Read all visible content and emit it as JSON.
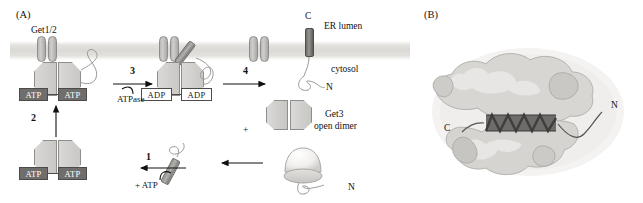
{
  "figure": {
    "panels": [
      {
        "id": "A",
        "label": "(A)"
      },
      {
        "id": "B",
        "label": "(B)"
      }
    ]
  },
  "panel_a": {
    "label": "(A)",
    "compartments": {
      "lumen": "ER lumen",
      "cytosol": "cytosol"
    },
    "receptor_label": "Get1/2",
    "open_dimer_label_line1": "Get3",
    "open_dimer_label_line2": "open dimer",
    "steps": [
      {
        "number": "1",
        "annotation": "+ ATP"
      },
      {
        "number": "2",
        "annotation": ""
      },
      {
        "number": "3",
        "annotation": "ATPase"
      },
      {
        "number": "4",
        "annotation": ""
      }
    ],
    "nucleotides": [
      {
        "state": "ATP",
        "label": "ATP",
        "site": "membrane-bound-left"
      },
      {
        "state": "ATP",
        "label": "ATP",
        "site": "membrane-bound-right"
      },
      {
        "state": "ADP",
        "label": "ADP",
        "site": "hydrolyzed-left"
      },
      {
        "state": "ADP",
        "label": "ADP",
        "site": "hydrolyzed-right"
      },
      {
        "state": "ATP",
        "label": "ATP",
        "site": "cytosolic-left"
      },
      {
        "state": "ATP",
        "label": "ATP",
        "site": "cytosolic-right"
      }
    ],
    "terminus_labels": [
      {
        "text": "C",
        "on": "inserted-ta-protein-top"
      },
      {
        "text": "N",
        "on": "inserted-ta-protein-tail"
      },
      {
        "text": "N",
        "on": "ribosome-nascent-chain"
      }
    ],
    "plus_sign": "+"
  },
  "panel_b": {
    "label": "(B)",
    "terminus_labels": [
      {
        "text": "C",
        "position": "left"
      },
      {
        "text": "N",
        "position": "upper-right"
      }
    ]
  },
  "colors": {
    "membrane": "#dbd9d5",
    "atp_box_fill": "#6f6e6c",
    "adp_box_fill": "#ffffff",
    "get3_fill": "#d5d4d1",
    "outline": "#4c4b49",
    "ta_helix": "#6d6c6a",
    "surface_light": "#e8e7e5",
    "surface_dark": "#8b8a88"
  }
}
